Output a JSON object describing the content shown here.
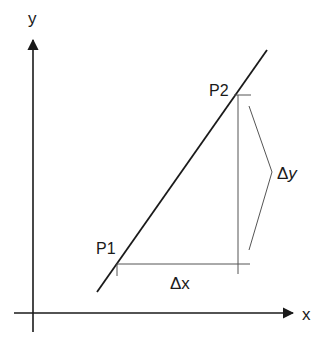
{
  "diagram": {
    "axes": {
      "x_label": "x",
      "y_label": "y"
    },
    "points": [
      {
        "id": "p1",
        "label": "P1"
      },
      {
        "id": "p2",
        "label": "P2"
      }
    ],
    "deltas": {
      "dx_label": "Δx",
      "dy_delta": "Δ",
      "dy_var": "y"
    },
    "colors": {
      "axis": "#1a1a1a",
      "line": "#1a1a1a",
      "guide": "#555555",
      "text": "#1a1a1a"
    }
  }
}
